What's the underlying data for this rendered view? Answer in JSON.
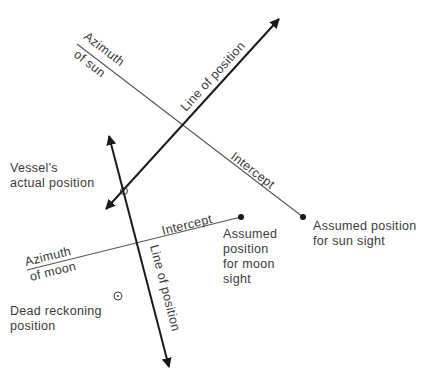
{
  "diagram": {
    "type": "celestial-navigation-fix",
    "colors": {
      "background": "#ffffff",
      "line": "#1a1a1a",
      "thin_line": "#555555",
      "text": "#3a3a3a"
    },
    "labels": {
      "azimuth_sun_1": "Azimuth",
      "azimuth_sun_2": "of sun",
      "lop_sun": "Line of position",
      "intercept_sun": "Intercept",
      "assumed_sun_1": "Assumed position",
      "assumed_sun_2": "for sun sight",
      "vessel_1": "Vessel's",
      "vessel_2": "actual position",
      "intercept_moon": "Intercept",
      "assumed_moon_1": "Assumed",
      "assumed_moon_2": "position",
      "assumed_moon_3": "for moon",
      "assumed_moon_4": "sight",
      "azimuth_moon_1": "Azimuth",
      "azimuth_moon_2": "of moon",
      "lop_moon": "Line of position",
      "dr_1": "Dead reckoning",
      "dr_2": "position"
    },
    "nodes": [
      {
        "id": "vessel-actual-position",
        "symbol": "open-circle",
        "x": 124,
        "y": 191
      },
      {
        "id": "assumed-position-sun",
        "symbol": "dot",
        "x": 303,
        "y": 217
      },
      {
        "id": "assumed-position-moon",
        "symbol": "dot",
        "x": 241,
        "y": 217
      },
      {
        "id": "dead-reckoning-position",
        "symbol": "circle-dot",
        "x": 118,
        "y": 296
      }
    ],
    "edges": [
      {
        "id": "azimuth-sun",
        "from": [
          77,
          44
        ],
        "to": [
          303,
          217
        ],
        "style": "thin"
      },
      {
        "id": "lop-sun",
        "from": [
          104,
          211
        ],
        "to": [
          280,
          17
        ],
        "style": "bold-double-arrow"
      },
      {
        "id": "azimuth-moon",
        "from": [
          27,
          270
        ],
        "to": [
          241,
          217
        ],
        "style": "thin"
      },
      {
        "id": "lop-moon",
        "from": [
          108,
          133
        ],
        "to": [
          170,
          370
        ],
        "style": "bold-double-arrow"
      }
    ]
  }
}
